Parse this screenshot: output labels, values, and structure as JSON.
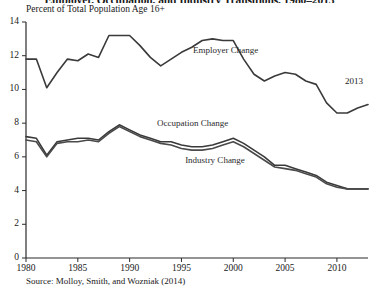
{
  "chart_data": {
    "type": "line",
    "title": "Employer, Occupation, and Industry Transitions, 1980–2013",
    "subtitle": "Percent of Total Population Age 16+",
    "xlabel": "",
    "ylabel": "",
    "xlim": [
      1980,
      2013
    ],
    "ylim": [
      0,
      14
    ],
    "ytick_labels": [
      "0",
      "2",
      "4",
      "6",
      "8",
      "10",
      "12",
      "14"
    ],
    "yticks": [
      0,
      2,
      4,
      6,
      8,
      10,
      12,
      14
    ],
    "xtick_labels": [
      "1980",
      "1985",
      "1990",
      "1995",
      "2000",
      "2005",
      "2010"
    ],
    "xticks": [
      1980,
      1985,
      1990,
      1995,
      2000,
      2005,
      2010
    ],
    "grid": false,
    "legend_position": "inline-annotations",
    "annotations": [
      {
        "text": "Employer Change",
        "x": 1996.5,
        "y": 11.2
      },
      {
        "text": "Occupation Change",
        "x": 1993.5,
        "y": 7.7
      },
      {
        "text": "Industry Change",
        "x": 1996.5,
        "y": 5.9
      },
      {
        "text": "2013",
        "x": 2012.4,
        "y": 10.4
      }
    ],
    "source": "Source: Molloy, Smith, and Wozniak (2014)",
    "x": [
      1980,
      1981,
      1982,
      1983,
      1984,
      1985,
      1986,
      1987,
      1988,
      1989,
      1990,
      1991,
      1992,
      1993,
      1994,
      1995,
      1996,
      1997,
      1998,
      1999,
      2000,
      2001,
      2002,
      2003,
      2004,
      2005,
      2006,
      2007,
      2008,
      2009,
      2010,
      2011,
      2012,
      2013
    ],
    "series": [
      {
        "name": "Employer Change",
        "color": "#3a3a3a",
        "values": [
          11.8,
          11.8,
          10.1,
          11.0,
          11.8,
          11.7,
          12.1,
          11.9,
          13.2,
          13.2,
          13.2,
          12.6,
          11.9,
          11.4,
          11.8,
          12.2,
          12.5,
          12.9,
          13.0,
          12.9,
          12.9,
          11.8,
          10.9,
          10.5,
          10.8,
          11.0,
          10.9,
          10.5,
          10.3,
          9.2,
          8.6,
          8.6,
          8.9,
          9.1
        ]
      },
      {
        "name": "Occupation Change",
        "color": "#3a3a3a",
        "values": [
          7.2,
          7.1,
          6.1,
          6.9,
          7.0,
          7.1,
          7.1,
          7.0,
          7.5,
          7.9,
          7.6,
          7.3,
          7.1,
          6.9,
          6.9,
          6.7,
          6.6,
          6.6,
          6.7,
          6.9,
          7.1,
          6.8,
          6.4,
          6.0,
          5.5,
          5.5,
          5.3,
          5.1,
          4.9,
          4.5,
          4.3,
          4.1,
          4.1,
          4.1
        ]
      },
      {
        "name": "Industry Change",
        "color": "#4a4a4a",
        "values": [
          7.0,
          6.9,
          6.0,
          6.8,
          6.9,
          6.9,
          7.0,
          6.9,
          7.4,
          7.8,
          7.5,
          7.2,
          7.0,
          6.8,
          6.7,
          6.5,
          6.4,
          6.4,
          6.5,
          6.7,
          6.9,
          6.6,
          6.2,
          5.8,
          5.4,
          5.3,
          5.2,
          5.0,
          4.8,
          4.4,
          4.2,
          4.1,
          4.1,
          4.1
        ]
      }
    ]
  }
}
